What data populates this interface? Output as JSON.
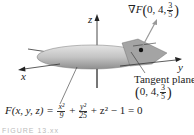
{
  "figure": {
    "axes": {
      "x_label": "x",
      "y_label": "y",
      "z_label": "z"
    },
    "gradient_label": {
      "prefix": "∇F",
      "point_start": "0, 4,",
      "frac_num": "3",
      "frac_den": "5"
    },
    "tangent_label": {
      "line1": "Tangent plane at",
      "point_start": "0, 4,",
      "frac_num": "3",
      "frac_den": "5"
    },
    "equation": {
      "lhs": "F(x, y, z) =",
      "t1_num": "x²",
      "t1_den": "9",
      "plus1": "+",
      "t2_num": "y²",
      "t2_den": "25",
      "rest": "+ z² − 1 = 0"
    },
    "caption": "FIGURE 13.xx",
    "colors": {
      "surface": "#c8c8c8",
      "surface_shadow": "#9a9a9a",
      "plane": "#a8a8a8",
      "point": "#111111",
      "axis": "#333333"
    }
  }
}
